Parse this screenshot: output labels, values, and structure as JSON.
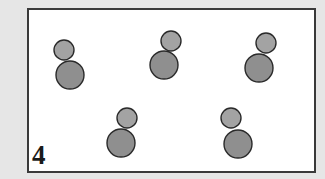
{
  "panel": {
    "label": "4"
  },
  "colors": {
    "background": "#e6e6e6",
    "frame_fill": "#ffffff",
    "frame_border": "#3a3a3a",
    "small_circle_fill": "#a3a3a3",
    "large_circle_fill": "#8f8f8f",
    "circle_stroke": "#2a2a2a"
  },
  "figures": [
    {
      "id": 1,
      "small": {
        "cx": 64,
        "cy": 50,
        "r": 10
      },
      "large": {
        "cx": 70,
        "cy": 75,
        "r": 14
      }
    },
    {
      "id": 2,
      "small": {
        "cx": 171,
        "cy": 41,
        "r": 10
      },
      "large": {
        "cx": 164,
        "cy": 65,
        "r": 14
      }
    },
    {
      "id": 3,
      "small": {
        "cx": 266,
        "cy": 43,
        "r": 10
      },
      "large": {
        "cx": 259,
        "cy": 68,
        "r": 14
      }
    },
    {
      "id": 4,
      "small": {
        "cx": 127,
        "cy": 118,
        "r": 10
      },
      "large": {
        "cx": 121,
        "cy": 143,
        "r": 14
      }
    },
    {
      "id": 5,
      "small": {
        "cx": 231,
        "cy": 118,
        "r": 10
      },
      "large": {
        "cx": 238,
        "cy": 144,
        "r": 14
      }
    }
  ]
}
